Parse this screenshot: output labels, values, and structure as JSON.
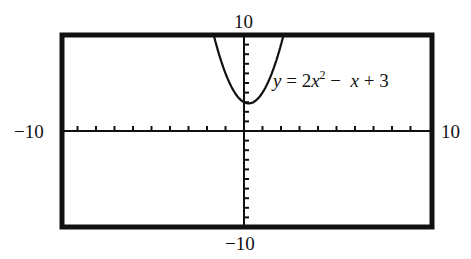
{
  "chart_data": {
    "type": "line",
    "title": "",
    "equation": "y = 2x^2 - x + 3",
    "equation_parts": {
      "lhs": "y",
      "eq": " = 2",
      "x1": "x",
      "exp": "2",
      "minus": " −  ",
      "x2": "x",
      "rest": " + 3"
    },
    "xlabel": "",
    "ylabel": "",
    "xlim": [
      -10,
      10
    ],
    "ylim": [
      -10,
      10
    ],
    "tick_labels": {
      "xmin": "−10",
      "xmax": "10",
      "ymin": "−10",
      "ymax": "10"
    },
    "tick_step": 1,
    "grid": false,
    "series": [
      {
        "name": "y = 2x^2 - x + 3",
        "x": [
          -1.64,
          -1.0,
          -0.5,
          0.0,
          0.25,
          0.5,
          1.0,
          1.5,
          2.14
        ],
        "y": [
          10,
          6,
          4,
          3,
          2.875,
          3,
          4,
          6,
          10
        ]
      }
    ],
    "vertex": [
      0.25,
      2.875
    ]
  }
}
